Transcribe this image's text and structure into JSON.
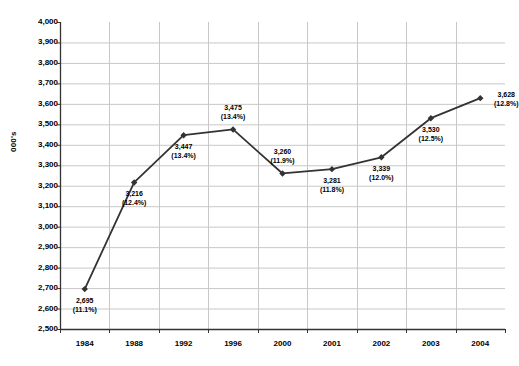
{
  "chart_data": {
    "type": "line",
    "title": "",
    "xlabel": "",
    "ylabel": "000's",
    "ylim": [
      2500,
      4000
    ],
    "ytick_step": 100,
    "yticks": [
      "4,000",
      "3,900",
      "3,800",
      "3,700",
      "3,600",
      "3,500",
      "3,400",
      "3,300",
      "3,200",
      "3,100",
      "3,000",
      "2,900",
      "2,800",
      "2,700",
      "2,600",
      "2,500"
    ],
    "categories": [
      "1984",
      "1988",
      "1992",
      "1996",
      "2000",
      "2001",
      "2002",
      "2003",
      "2004"
    ],
    "values": [
      2695,
      3216,
      3447,
      3475,
      3260,
      3281,
      3339,
      3530,
      3628
    ],
    "value_labels": [
      "2,695",
      "3,216",
      "3,447",
      "3,475",
      "3,260",
      "3,281",
      "3,339",
      "3,530",
      "3,628"
    ],
    "percent_labels": [
      "(11.1%)",
      "(12.4%)",
      "(13.4%)",
      "(13.4%)",
      "(11.9%)",
      "(11.8%)",
      "(12.0%)",
      "(12.5%)",
      "(12.8%)"
    ],
    "label_positions": [
      "below",
      "below",
      "below",
      "above",
      "above",
      "below",
      "below",
      "below",
      "right"
    ],
    "grid": {
      "horizontal": true,
      "vertical": true
    },
    "legend": "none",
    "series_color": "#333333",
    "grid_color": "#c8c8c8",
    "axis_color": "#333333",
    "marker": "diamond"
  },
  "meta": {
    "series_name": "series-1"
  }
}
